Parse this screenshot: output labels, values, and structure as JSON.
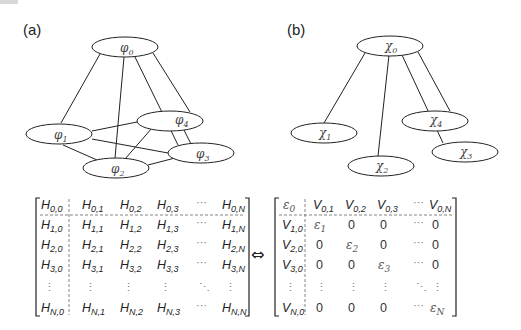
{
  "panels": {
    "a": {
      "label": "(a)",
      "nodes": [
        {
          "id": "phi0",
          "symbol": "φ",
          "sub": "0"
        },
        {
          "id": "phi1",
          "symbol": "φ",
          "sub": "1"
        },
        {
          "id": "phi2",
          "symbol": "φ",
          "sub": "2"
        },
        {
          "id": "phi3",
          "symbol": "φ",
          "sub": "3"
        },
        {
          "id": "phi4",
          "symbol": "φ",
          "sub": "4"
        }
      ],
      "edges": [
        [
          "phi0",
          "phi1"
        ],
        [
          "phi0",
          "phi2"
        ],
        [
          "phi0",
          "phi3"
        ],
        [
          "phi0",
          "phi4"
        ],
        [
          "phi1",
          "phi2"
        ],
        [
          "phi1",
          "phi3"
        ],
        [
          "phi1",
          "phi4"
        ],
        [
          "phi2",
          "phi3"
        ],
        [
          "phi2",
          "phi4"
        ]
      ]
    },
    "b": {
      "label": "(b)",
      "nodes": [
        {
          "id": "chi0",
          "symbol": "χ",
          "sub": "0"
        },
        {
          "id": "chi1",
          "symbol": "χ",
          "sub": "1"
        },
        {
          "id": "chi2",
          "symbol": "χ",
          "sub": "2"
        },
        {
          "id": "chi3",
          "symbol": "χ",
          "sub": "3"
        },
        {
          "id": "chi4",
          "symbol": "χ",
          "sub": "4"
        }
      ],
      "edges": [
        [
          "chi0",
          "chi1"
        ],
        [
          "chi0",
          "chi2"
        ],
        [
          "chi0",
          "chi3"
        ],
        [
          "chi0",
          "chi4"
        ]
      ]
    }
  },
  "equivalence_symbol": "⇔",
  "matrix_H": {
    "rows": [
      [
        {
          "b": "H",
          "s": "0,0"
        },
        {
          "b": "H",
          "s": "0,1"
        },
        {
          "b": "H",
          "s": "0,2"
        },
        {
          "b": "H",
          "s": "0,3"
        },
        {
          "b": "···",
          "s": ""
        },
        {
          "b": "H",
          "s": "0,N"
        }
      ],
      [
        {
          "b": "H",
          "s": "1,0"
        },
        {
          "b": "H",
          "s": "1,1"
        },
        {
          "b": "H",
          "s": "1,2"
        },
        {
          "b": "H",
          "s": "1,3"
        },
        {
          "b": "···",
          "s": ""
        },
        {
          "b": "H",
          "s": "1,N"
        }
      ],
      [
        {
          "b": "H",
          "s": "2,0"
        },
        {
          "b": "H",
          "s": "2,1"
        },
        {
          "b": "H",
          "s": "2,2"
        },
        {
          "b": "H",
          "s": "2,3"
        },
        {
          "b": "···",
          "s": ""
        },
        {
          "b": "H",
          "s": "2,N"
        }
      ],
      [
        {
          "b": "H",
          "s": "3,0"
        },
        {
          "b": "H",
          "s": "3,1"
        },
        {
          "b": "H",
          "s": "3,2"
        },
        {
          "b": "H",
          "s": "3,3"
        },
        {
          "b": "···",
          "s": ""
        },
        {
          "b": "H",
          "s": "3,N"
        }
      ],
      [
        {
          "b": "⋮",
          "s": ""
        },
        {
          "b": "⋮",
          "s": ""
        },
        {
          "b": "⋮",
          "s": ""
        },
        {
          "b": "⋮",
          "s": ""
        },
        {
          "b": "⋱",
          "s": ""
        },
        {
          "b": "⋮",
          "s": ""
        }
      ],
      [
        {
          "b": "H",
          "s": "N,0"
        },
        {
          "b": "H",
          "s": "N,1"
        },
        {
          "b": "H",
          "s": "N,2"
        },
        {
          "b": "H",
          "s": "N,3"
        },
        {
          "b": "···",
          "s": ""
        },
        {
          "b": "H",
          "s": "N,N"
        }
      ]
    ]
  },
  "matrix_V": {
    "rows": [
      [
        {
          "b": "ε",
          "s": "0"
        },
        {
          "b": "V",
          "s": "0,1"
        },
        {
          "b": "V",
          "s": "0,2"
        },
        {
          "b": "V",
          "s": "0,3"
        },
        {
          "b": "···",
          "s": ""
        },
        {
          "b": "V",
          "s": "0,N"
        }
      ],
      [
        {
          "b": "V",
          "s": "1,0"
        },
        {
          "b": "ε",
          "s": "1"
        },
        {
          "b": "0",
          "s": ""
        },
        {
          "b": "0",
          "s": ""
        },
        {
          "b": "···",
          "s": ""
        },
        {
          "b": "0",
          "s": ""
        }
      ],
      [
        {
          "b": "V",
          "s": "2,0"
        },
        {
          "b": "0",
          "s": ""
        },
        {
          "b": "ε",
          "s": "2"
        },
        {
          "b": "0",
          "s": ""
        },
        {
          "b": "···",
          "s": ""
        },
        {
          "b": "0",
          "s": ""
        }
      ],
      [
        {
          "b": "V",
          "s": "3,0"
        },
        {
          "b": "0",
          "s": ""
        },
        {
          "b": "0",
          "s": ""
        },
        {
          "b": "ε",
          "s": "3"
        },
        {
          "b": "···",
          "s": ""
        },
        {
          "b": "0",
          "s": ""
        }
      ],
      [
        {
          "b": "⋮",
          "s": ""
        },
        {
          "b": "⋮",
          "s": ""
        },
        {
          "b": "⋮",
          "s": ""
        },
        {
          "b": "⋮",
          "s": ""
        },
        {
          "b": "⋱",
          "s": ""
        },
        {
          "b": "⋮",
          "s": ""
        }
      ],
      [
        {
          "b": "V",
          "s": "N,0"
        },
        {
          "b": "0",
          "s": ""
        },
        {
          "b": "0",
          "s": ""
        },
        {
          "b": "0",
          "s": ""
        },
        {
          "b": "···",
          "s": ""
        },
        {
          "b": "ε",
          "s": "N"
        }
      ]
    ]
  }
}
